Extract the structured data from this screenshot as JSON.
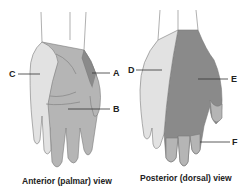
{
  "colors": {
    "light": "#e2e2e2",
    "medium": "#b5b5b5",
    "dark": "#8a8a8a",
    "outline": "#7a7a7a",
    "label_line": "#333333"
  },
  "anterior": {
    "caption": "Anterior (palmar) view",
    "labels": [
      {
        "id": "A",
        "text": "A"
      },
      {
        "id": "B",
        "text": "B"
      },
      {
        "id": "C",
        "text": "C"
      }
    ]
  },
  "posterior": {
    "caption": "Posterior (dorsal) view",
    "labels": [
      {
        "id": "D",
        "text": "D"
      },
      {
        "id": "E",
        "text": "E"
      },
      {
        "id": "F",
        "text": "F"
      }
    ]
  }
}
